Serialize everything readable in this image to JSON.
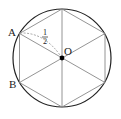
{
  "diagram": {
    "type": "circle-inscribed-hexagon",
    "points": {
      "A": "A",
      "B": "B",
      "O": "O"
    },
    "fraction_label": {
      "numerator": "1",
      "denominator": "2"
    },
    "colors": {
      "circle": "#222222",
      "hexagon": "#888888",
      "dashed": "#999999",
      "center_dot": "#000000"
    }
  }
}
